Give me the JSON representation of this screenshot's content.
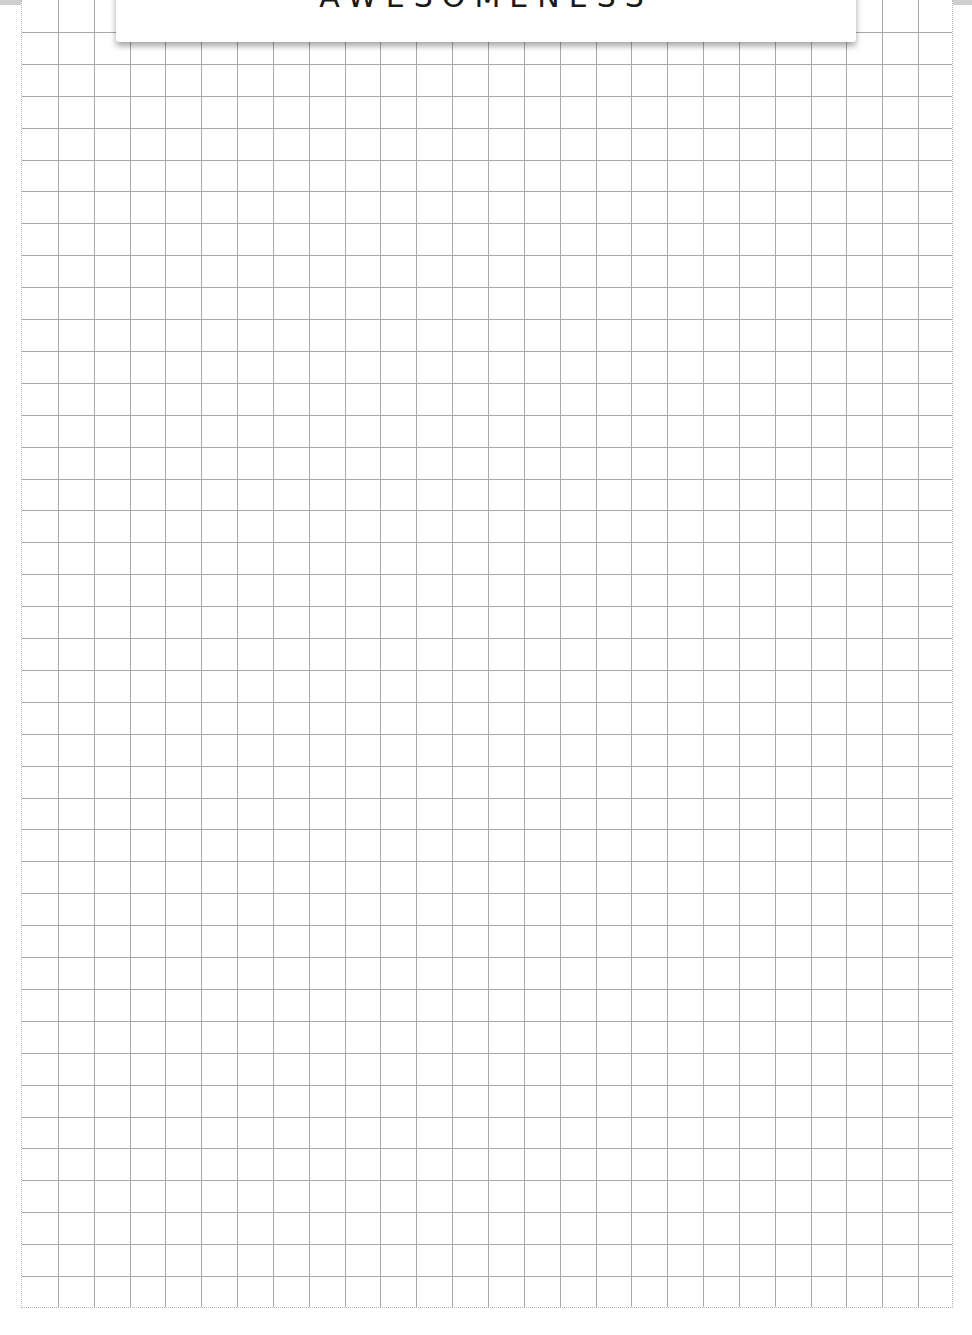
{
  "page": {
    "title_card": {
      "text": "AWESOMENESS"
    },
    "grid": {
      "columns": 26,
      "rows": 40,
      "cell_width_px": 35.8,
      "cell_height_px": 31.9,
      "line_color": "#a8a8a8",
      "border_style": "dotted"
    },
    "colors": {
      "background": "#ffffff",
      "top_band": "#cfcfcf",
      "text": "#1a1a1a"
    }
  }
}
